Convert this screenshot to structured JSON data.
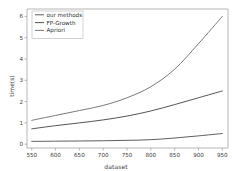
{
  "chart_data": {
    "type": "line",
    "title": "",
    "subtitle": "",
    "xlabel": "dataset",
    "ylabel": "time(s)",
    "x": [
      550,
      600,
      650,
      700,
      750,
      800,
      850,
      900,
      950
    ],
    "xticks": [
      550,
      600,
      650,
      700,
      750,
      800,
      850,
      900,
      950
    ],
    "yticks": [
      0,
      1,
      2,
      3,
      4,
      5,
      6
    ],
    "xlim": [
      540,
      962
    ],
    "ylim": [
      -0.18,
      6.35
    ],
    "grid": false,
    "legend_position": "upper left",
    "legend_frame": true,
    "series": [
      {
        "name": "our methods",
        "color": "#555555",
        "values": [
          0.13,
          0.14,
          0.15,
          0.16,
          0.18,
          0.21,
          0.29,
          0.39,
          0.5
        ]
      },
      {
        "name": "FP-Growth",
        "color": "#4a4a4a",
        "values": [
          0.72,
          0.87,
          1.0,
          1.14,
          1.32,
          1.56,
          1.86,
          2.18,
          2.5
        ]
      },
      {
        "name": "Apriori",
        "color": "#737373",
        "values": [
          1.12,
          1.35,
          1.58,
          1.82,
          2.18,
          2.7,
          3.52,
          4.72,
          6.0
        ]
      }
    ]
  },
  "axes": {
    "spine_color": "#9a9a9a",
    "tick_color": "#9a9a9a",
    "background": "#ffffff"
  }
}
